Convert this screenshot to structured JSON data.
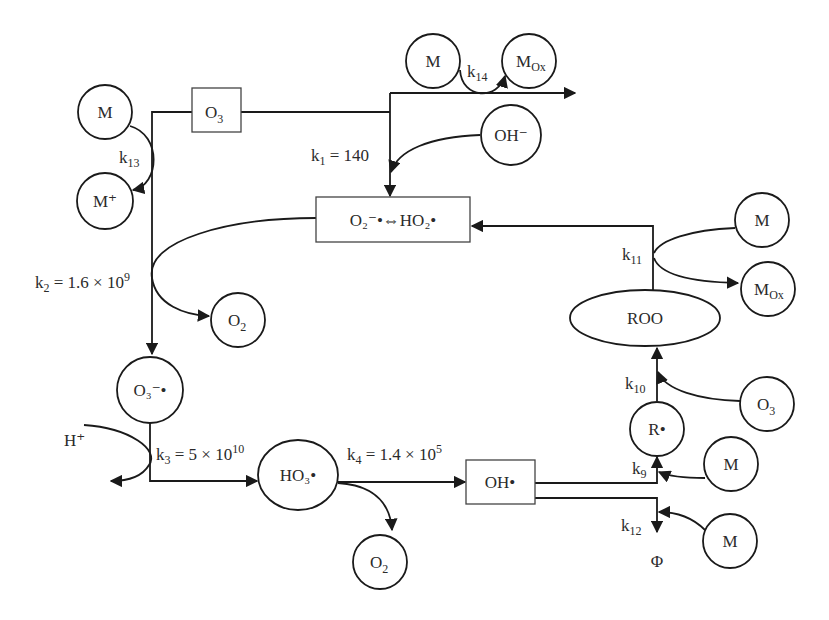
{
  "diagram": {
    "nodes": {
      "o3_box": {
        "text": "O",
        "sub": "3"
      },
      "superoxide_box": {
        "text": "O₂⁻•⇔HO₂•"
      },
      "m_top_left": {
        "text": "M"
      },
      "m_plus": {
        "text": "M⁺"
      },
      "m_top": {
        "text": "M"
      },
      "mox_top": {
        "text": "M",
        "sub": "Ox"
      },
      "oh_minus": {
        "text": "OH⁻"
      },
      "o2_mid": {
        "text": "O",
        "sub": "2"
      },
      "o3_radical": {
        "text": "O₃⁻•"
      },
      "h_plus": {
        "text": "H⁺"
      },
      "ho3_radical": {
        "text": "HO₃•"
      },
      "o2_bottom": {
        "text": "O",
        "sub": "2"
      },
      "oh_radical_box": {
        "text": "OH•"
      },
      "m_right_top": {
        "text": "M"
      },
      "mox_right": {
        "text": "M",
        "sub": "Ox"
      },
      "roo": {
        "text": "ROO"
      },
      "o3_right": {
        "text": "O",
        "sub": "3"
      },
      "r_radical": {
        "text": "R•"
      },
      "m_k9": {
        "text": "M"
      },
      "m_k12": {
        "text": "M"
      },
      "phi": {
        "text": "Φ"
      }
    },
    "rates": {
      "k1": {
        "k": "k",
        "sub": "1",
        "value": " = 140"
      },
      "k2": {
        "k": "k",
        "sub": "2",
        "value": " = 1.6 × 10",
        "exp": "9"
      },
      "k3": {
        "k": "k",
        "sub": "3",
        "value": " = 5 × 10",
        "exp": "10"
      },
      "k4": {
        "k": "k",
        "sub": "4",
        "value": " = 1.4 × 10",
        "exp": "5"
      },
      "k9": {
        "k": "k",
        "sub": "9"
      },
      "k10": {
        "k": "k",
        "sub": "10"
      },
      "k11": {
        "k": "k",
        "sub": "11"
      },
      "k12": {
        "k": "k",
        "sub": "12"
      },
      "k13": {
        "k": "k",
        "sub": "13"
      },
      "k14": {
        "k": "k",
        "sub": "14"
      }
    }
  }
}
